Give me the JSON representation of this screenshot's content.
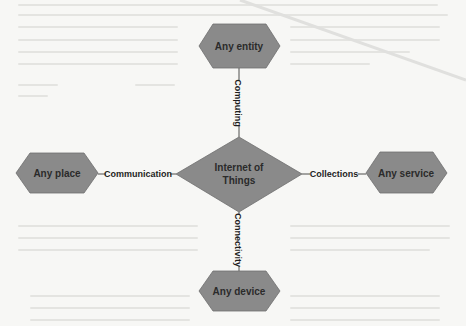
{
  "diagram": {
    "center": {
      "label_line1": "Internet of",
      "label_line2": "Things"
    },
    "nodes": {
      "top": "Any entity",
      "left": "Any place",
      "right": "Any service",
      "bottom": "Any device"
    },
    "edges": {
      "top": "Computing",
      "left": "Communication",
      "right": "Collections",
      "bottom": "Connectivity"
    },
    "colors": {
      "shape_fill": "#8a8a8a",
      "background": "#f7f7f5",
      "text": "#2b2b2b"
    }
  }
}
